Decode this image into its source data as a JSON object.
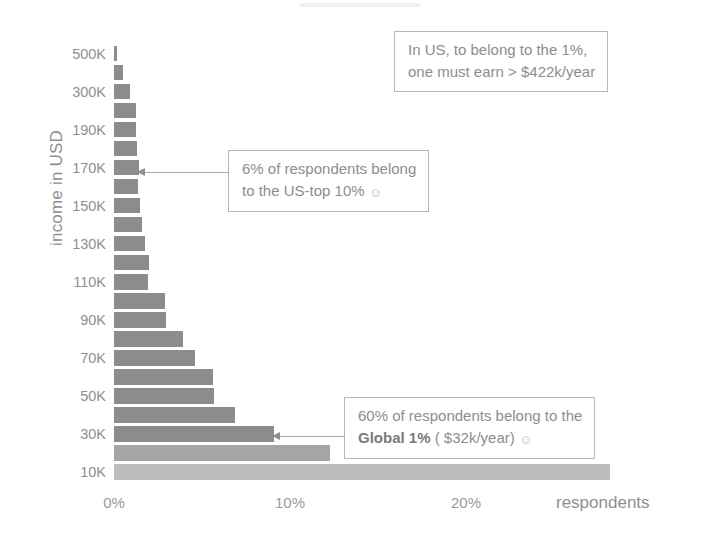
{
  "chart_data": {
    "type": "bar",
    "orientation": "horizontal",
    "title": "",
    "xlabel": "respondents",
    "ylabel": "income in USD",
    "xlim": [
      0,
      30
    ],
    "x_ticks": [
      "0%",
      "10%",
      "20%"
    ],
    "x_tick_values": [
      0,
      10,
      20
    ],
    "grid": false,
    "legend": false,
    "categories": [
      "500K",
      "400K",
      "300K",
      "230K",
      "190K",
      "180K",
      "170K",
      "160K",
      "150K",
      "140K",
      "130K",
      "120K",
      "110K",
      "100K",
      "90K",
      "80K",
      "70K",
      "60K",
      "50K",
      "40K",
      "30K",
      "20K",
      "10K"
    ],
    "y_tick_labels": [
      "500K",
      "300K",
      "190K",
      "170K",
      "150K",
      "130K",
      "110K",
      "90K",
      "70K",
      "50K",
      "30K",
      "10K"
    ],
    "values": [
      0.15,
      0.5,
      0.9,
      1.25,
      1.25,
      1.3,
      1.4,
      1.35,
      1.45,
      1.6,
      1.75,
      2.0,
      1.95,
      2.9,
      2.95,
      3.9,
      4.6,
      5.6,
      5.7,
      6.9,
      9.1,
      12.3,
      28.2
    ],
    "bar_tones": [
      "dark",
      "dark",
      "dark",
      "dark",
      "dark",
      "dark",
      "dark",
      "dark",
      "dark",
      "dark",
      "dark",
      "dark",
      "dark",
      "dark",
      "dark",
      "dark",
      "dark",
      "dark",
      "dark",
      "dark",
      "dark",
      "mid",
      "light"
    ],
    "annotations": [
      {
        "id": "us-one-percent",
        "lines": [
          "In US, to belong to the 1%,",
          "one must earn > $422k/year"
        ],
        "has_arrow": false
      },
      {
        "id": "us-top-ten",
        "lines": [
          "6% of respondents belong",
          "to the US-top 10%"
        ],
        "emoji": "☺",
        "has_arrow": true,
        "points_at_category": "170K"
      },
      {
        "id": "global-one-percent",
        "lines": [
          "60% of respondents belong to the",
          "Global 1% ( $32k/year)"
        ],
        "bold_part": "Global 1%",
        "emoji": "☺",
        "has_arrow": true,
        "points_at_category": "30K"
      }
    ],
    "colors": {
      "bar_dark": "#8c8c8c",
      "bar_mid": "#a5a5a5",
      "bar_light": "#bdbdbd",
      "text": "#8d8d8d",
      "callout_border": "#b6b6b6",
      "background": "#ffffff"
    }
  },
  "axes": {
    "y_title": "income in USD",
    "x_title": "respondents"
  },
  "callouts": {
    "us_one_percent": {
      "line1": "In US, to belong to the 1%,",
      "line2": "one must earn > $422k/year"
    },
    "us_top_ten": {
      "line1": "6% of respondents belong",
      "line2_prefix": "to the US-top 10%",
      "emoji": "☺"
    },
    "global_one_percent": {
      "line1": "60% of respondents belong to the",
      "line2_bold": "Global 1%",
      "line2_rest": " ( $32k/year)",
      "emoji": "☺"
    }
  }
}
